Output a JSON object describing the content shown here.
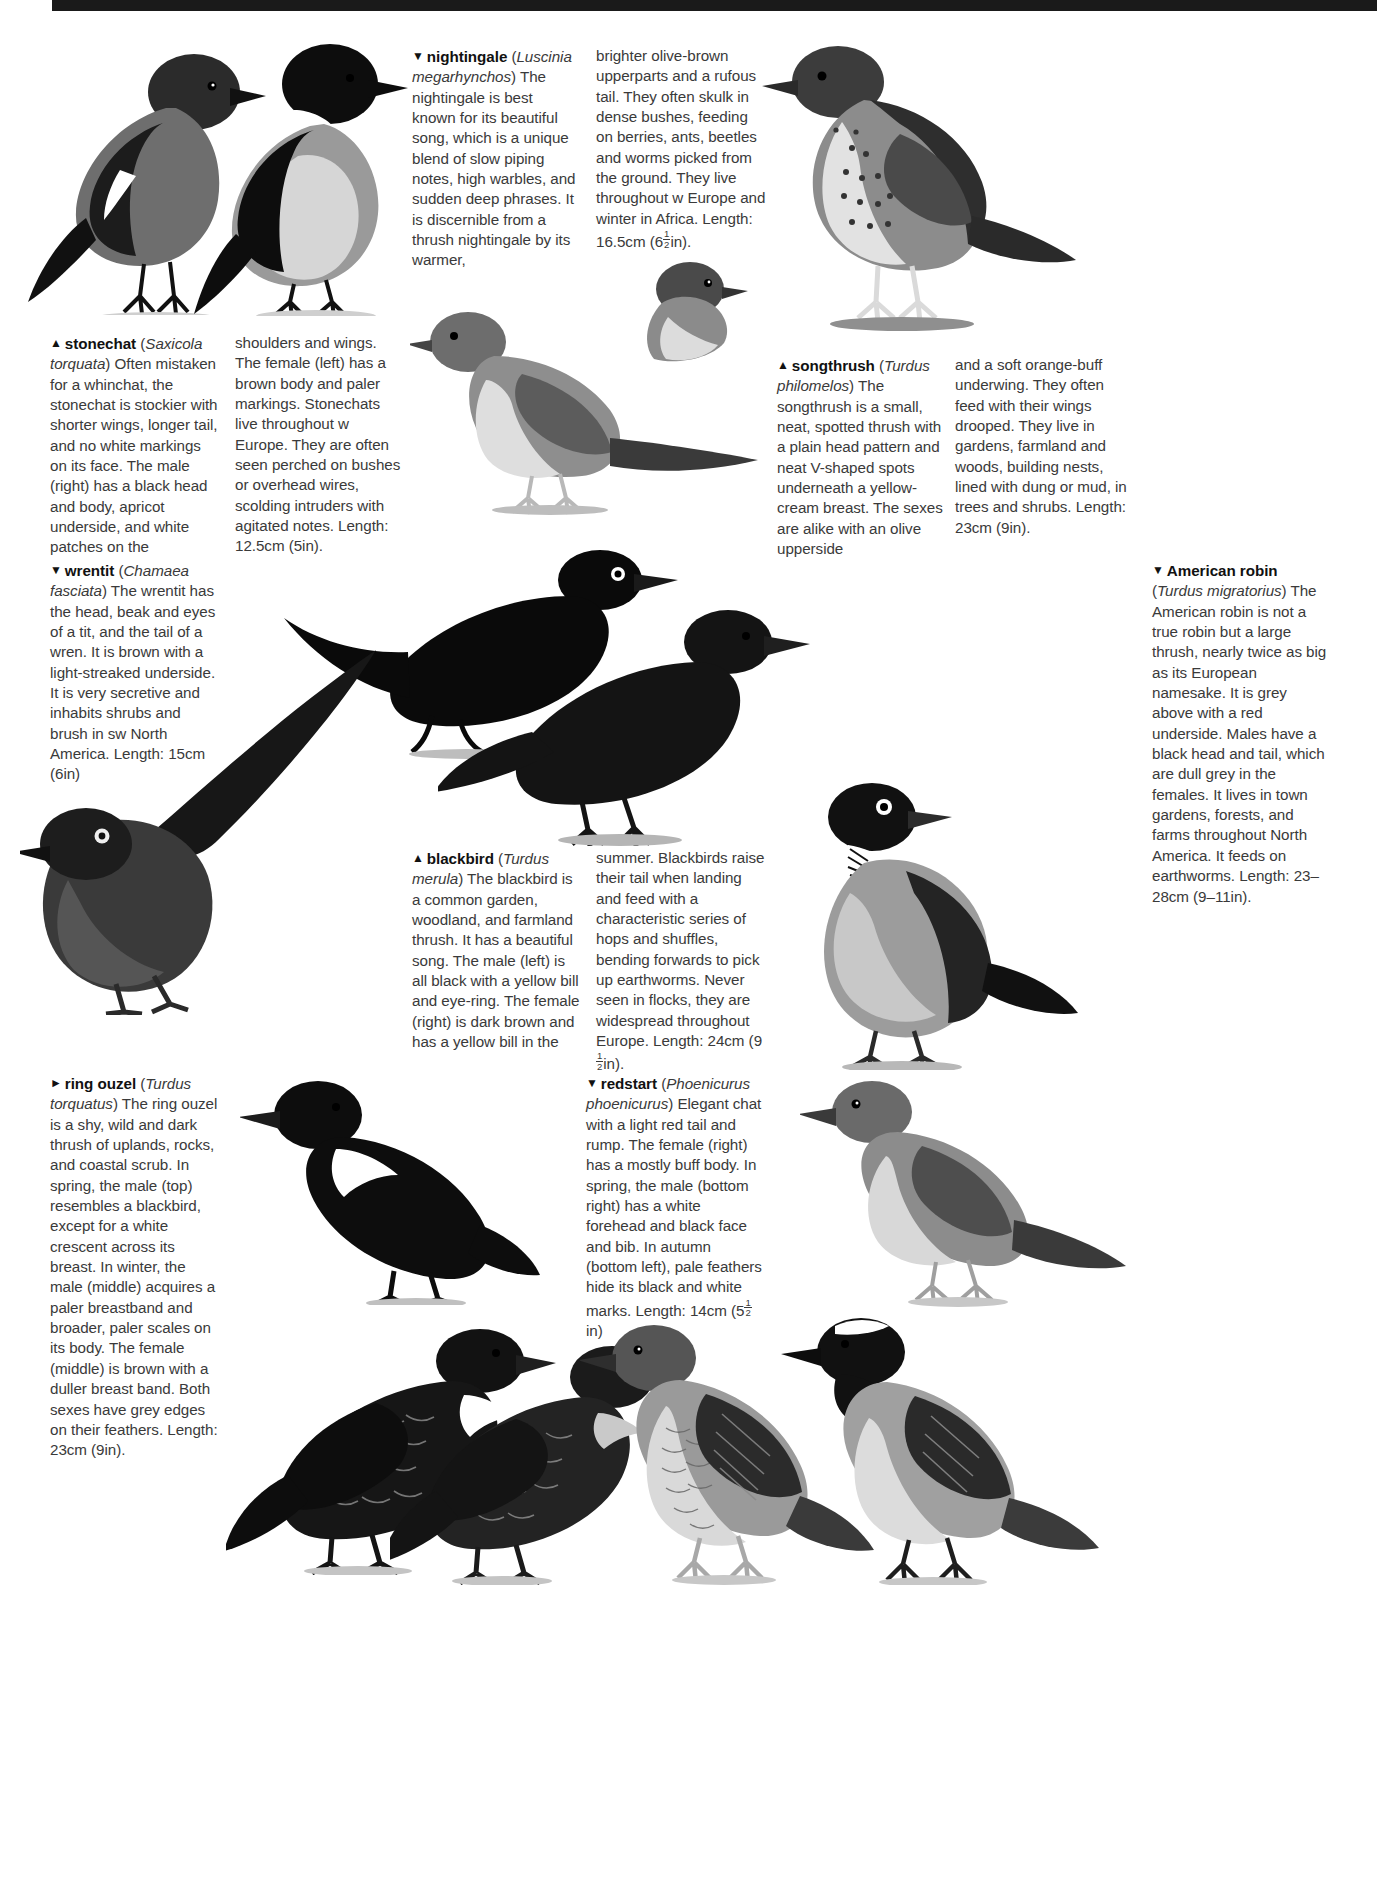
{
  "page": {
    "number": "",
    "band_color": "#1a1a1a"
  },
  "entries": {
    "nightingale": {
      "marker": "▼",
      "name": "nightingale",
      "latin": "Luscinia megarhynchos",
      "col1": "The nightingale is best known for its beautiful song, which is a unique blend of slow piping notes, high warbles, and sudden deep phrases. It is discernible from a thrush nightingale by its warmer,",
      "col2": "brighter olive-brown upperparts and a rufous tail. They often skulk in dense bushes, feeding on berries, ants, beetles and worms picked from the ground. They live throughout w Europe and winter in Africa.",
      "length_prefix": "Length: 16.5cm (6",
      "length_num": "1",
      "length_den": "2",
      "length_suffix": "in)."
    },
    "stonechat": {
      "marker": "▲",
      "name": "stonechat",
      "latin": "Saxicola torquata",
      "col1": "Often mistaken for a whinchat, the stonechat is stockier with shorter wings, longer tail, and no white markings on its face. The male (right) has a black head and body, apricot underside, and white patches on the",
      "col2": "shoulders and wings. The female (left) has a brown body and paler markings. Stonechats live throughout w Europe. They are often seen perched on bushes or overhead wires, scolding intruders with agitated notes. Length: 12.5cm (5in)."
    },
    "songthrush": {
      "marker": "▲",
      "name": "songthrush",
      "latin": "Turdus philomelos",
      "col1": "The songthrush is a small, neat, spotted thrush with a plain head pattern and neat V-shaped spots underneath a yellow-cream breast. The sexes are alike with an olive upperside",
      "col2": "and a soft orange-buff underwing. They often feed with their wings drooped. They live in gardens, farmland and woods, building nests, lined with dung or mud, in trees and shrubs. Length: 23cm (9in)."
    },
    "wrentit": {
      "marker": "▼",
      "name": "wrentit",
      "latin": "Chamaea fasciata",
      "col1": "The wrentit has the head, beak and eyes of a tit, and the tail of a wren. It is brown with a light-streaked underside. It is very secretive and inhabits shrubs and brush in sw North America. Length: 15cm (6in)"
    },
    "american_robin": {
      "marker": "▼",
      "name": "American robin",
      "latin": "Turdus migratorius",
      "col1": "The American robin is not a true robin but a large thrush, nearly twice as big as its European namesake. It is grey above with a red underside. Males have a black head and tail, which are dull grey in the females. It lives in town gardens, forests, and farms throughout North America. It feeds on earthworms. Length: 23–28cm (9–11in)."
    },
    "blackbird": {
      "marker": "▲",
      "name": "blackbird",
      "latin": "Turdus merula",
      "col1": "The blackbird is a common garden, woodland, and farmland thrush. It has a beautiful song. The male (left) is all black with a yellow bill and eye-ring. The female (right) is dark brown and has a yellow bill in the",
      "col2": "summer. Blackbirds raise their tail when landing and feed with a characteristic series of hops and shuffles, bending forwards to pick up earthworms. Never seen in flocks, they are widespread throughout Europe. Length:",
      "length_prefix": "24cm (9",
      "length_num": "1",
      "length_den": "2",
      "length_suffix": "in)."
    },
    "ring_ouzel": {
      "marker": "►",
      "name": "ring ouzel",
      "latin": "Turdus torquatus",
      "col1": "The ring ouzel is a shy, wild and dark thrush of uplands, rocks, and coastal scrub. In spring, the male (top) resembles a blackbird, except for a white crescent across its breast. In winter, the male (middle) acquires a paler breastband and broader, paler scales on its body. The female (middle) is brown with a duller breast band. Both sexes have grey edges on their feathers. Length: 23cm (9in)."
    },
    "redstart": {
      "marker": "▼",
      "name": "redstart",
      "latin": "Phoenicurus phoenicurus",
      "col1": "Elegant chat with a light red tail and rump. The female (right) has a mostly buff body. In spring, the male (bottom right) has a white forehead and black face and bib. In autumn (bottom left), pale feathers hide its black and white marks. Length: 14cm (5",
      "length_num": "1",
      "length_den": "2",
      "length_suffix": "in)"
    }
  },
  "illustrations": [
    {
      "id": "stonechat-female",
      "label": "stonechat female perched"
    },
    {
      "id": "stonechat-male",
      "label": "stonechat male perched"
    },
    {
      "id": "songthrush",
      "label": "songthrush standing"
    },
    {
      "id": "nightingale-main",
      "label": "nightingale perched"
    },
    {
      "id": "nightingale-small",
      "label": "nightingale head-on small"
    },
    {
      "id": "blackbird-male",
      "label": "blackbird male"
    },
    {
      "id": "blackbird-female",
      "label": "blackbird female"
    },
    {
      "id": "wrentit",
      "label": "wrentit with long tail"
    },
    {
      "id": "american-robin",
      "label": "American robin standing"
    },
    {
      "id": "ring-ouzel-male-spring",
      "label": "ring ouzel male spring"
    },
    {
      "id": "ring-ouzel-winter",
      "label": "ring ouzel winter"
    },
    {
      "id": "ring-ouzel-female",
      "label": "ring ouzel female"
    },
    {
      "id": "redstart-female",
      "label": "redstart female"
    },
    {
      "id": "redstart-autumn",
      "label": "redstart autumn male"
    },
    {
      "id": "redstart-male",
      "label": "redstart male spring"
    }
  ]
}
